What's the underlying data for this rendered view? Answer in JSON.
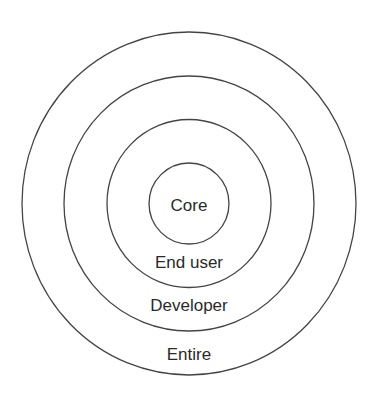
{
  "diagram": {
    "type": "concentric-circles",
    "center": {
      "x": 189,
      "y": 203.5
    },
    "line_color": "#444444",
    "text_color": "#2a2a2a",
    "rings": [
      {
        "id": "entire",
        "label": "Entire",
        "rx": 167,
        "ry": 171.5,
        "label_x": 189,
        "label_y": 360
      },
      {
        "id": "developer",
        "label": "Developer",
        "rx": 125,
        "ry": 127.5,
        "label_x": 189,
        "label_y": 311
      },
      {
        "id": "end-user",
        "label": "End user",
        "rx": 82,
        "ry": 84,
        "label_x": 189,
        "label_y": 268
      },
      {
        "id": "core",
        "label": "Core",
        "rx": 40,
        "ry": 40.5,
        "label_x": 189,
        "label_y": 211
      }
    ]
  }
}
